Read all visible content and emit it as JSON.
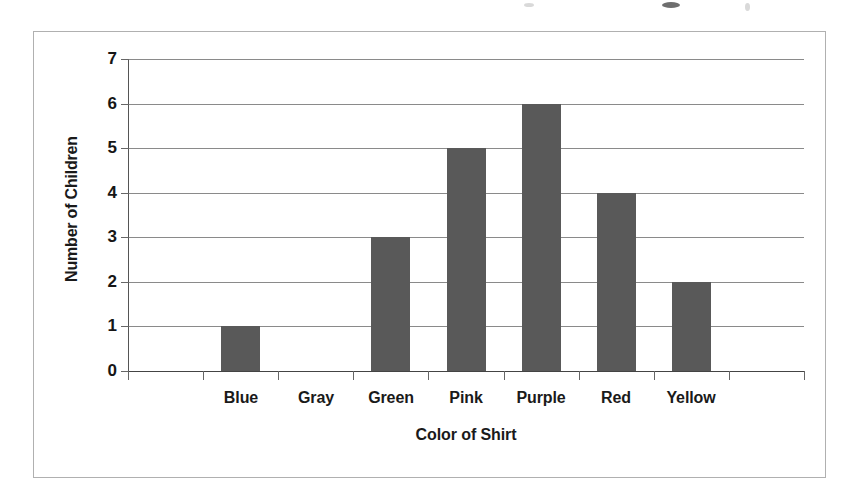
{
  "chart_data": {
    "type": "bar",
    "title": "",
    "xlabel": "Color of Shirt",
    "ylabel": "Number of Children",
    "categories": [
      "Blue",
      "Gray",
      "Green",
      "Pink",
      "Purple",
      "Red",
      "Yellow"
    ],
    "values": [
      1,
      0,
      3,
      5,
      6,
      4,
      2
    ],
    "ylim": [
      0,
      7
    ],
    "ytick_labels": [
      "0",
      "1",
      "2",
      "3",
      "4",
      "5",
      "6",
      "7"
    ],
    "ytick_values": [
      0,
      1,
      2,
      3,
      4,
      5,
      6,
      7
    ],
    "grid": true,
    "legend": "none",
    "bar_color": "#595959",
    "gridline_color": "#8a8a8a",
    "axis_color": "#555555",
    "frame_color": "#b0b0b0",
    "background_color": "#ffffff"
  }
}
